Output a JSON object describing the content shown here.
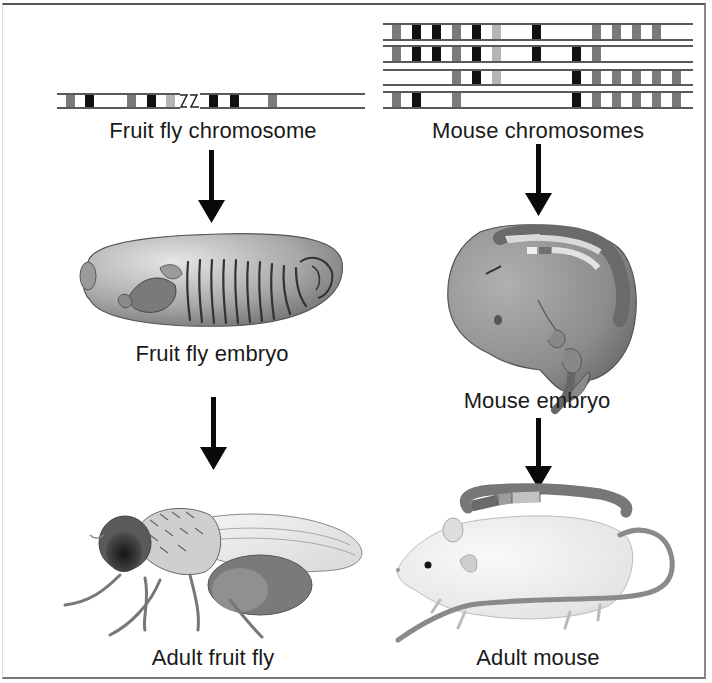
{
  "left_column": {
    "chromosome_label": "Fruit fly chromosome",
    "embryo_label": "Fruit fly embryo",
    "adult_label": "Adult fruit fly"
  },
  "right_column": {
    "chromosome_label": "Mouse chromosomes",
    "embryo_label": "Mouse embryo",
    "adult_label": "Adult mouse"
  },
  "colors": {
    "black_band": "#111111",
    "gray_band": "#7a7a7a",
    "light_band": "#b5b5b5",
    "line": "#222222",
    "arrow": "#0a0a0a"
  },
  "fly_chromosome": {
    "bands": [
      {
        "x": 66,
        "tone": "gray"
      },
      {
        "x": 85,
        "tone": "black"
      },
      {
        "x": 127,
        "tone": "gray"
      },
      {
        "x": 147,
        "tone": "black"
      },
      {
        "x": 166,
        "tone": "light"
      },
      {
        "x": 209,
        "tone": "black"
      },
      {
        "x": 230,
        "tone": "black"
      },
      {
        "x": 268,
        "tone": "gray"
      }
    ],
    "break_marker": "zigzag-break"
  },
  "mouse_chromosomes": [
    {
      "bands": [
        {
          "x": 392,
          "tone": "gray"
        },
        {
          "x": 412,
          "tone": "black"
        },
        {
          "x": 432,
          "tone": "black"
        },
        {
          "x": 452,
          "tone": "gray"
        },
        {
          "x": 472,
          "tone": "black"
        },
        {
          "x": 492,
          "tone": "light"
        },
        {
          "x": 532,
          "tone": "black"
        },
        {
          "x": 592,
          "tone": "gray"
        },
        {
          "x": 612,
          "tone": "gray"
        },
        {
          "x": 632,
          "tone": "gray"
        },
        {
          "x": 652,
          "tone": "gray"
        }
      ]
    },
    {
      "bands": [
        {
          "x": 392,
          "tone": "gray"
        },
        {
          "x": 412,
          "tone": "black"
        },
        {
          "x": 432,
          "tone": "black"
        },
        {
          "x": 452,
          "tone": "gray"
        },
        {
          "x": 472,
          "tone": "black"
        },
        {
          "x": 492,
          "tone": "light"
        },
        {
          "x": 532,
          "tone": "black"
        },
        {
          "x": 572,
          "tone": "black"
        },
        {
          "x": 592,
          "tone": "gray"
        }
      ]
    },
    {
      "bands": [
        {
          "x": 452,
          "tone": "gray"
        },
        {
          "x": 472,
          "tone": "black"
        },
        {
          "x": 492,
          "tone": "light"
        },
        {
          "x": 572,
          "tone": "black"
        },
        {
          "x": 592,
          "tone": "gray"
        },
        {
          "x": 612,
          "tone": "gray"
        },
        {
          "x": 632,
          "tone": "gray"
        },
        {
          "x": 652,
          "tone": "gray"
        },
        {
          "x": 672,
          "tone": "gray"
        }
      ]
    },
    {
      "bands": [
        {
          "x": 392,
          "tone": "gray"
        },
        {
          "x": 412,
          "tone": "black"
        },
        {
          "x": 452,
          "tone": "gray"
        },
        {
          "x": 572,
          "tone": "black"
        },
        {
          "x": 592,
          "tone": "gray"
        },
        {
          "x": 612,
          "tone": "gray"
        },
        {
          "x": 632,
          "tone": "gray"
        },
        {
          "x": 652,
          "tone": "gray"
        },
        {
          "x": 672,
          "tone": "gray"
        }
      ]
    }
  ],
  "arrows": [
    {
      "id": "fly-chromosome-to-embryo"
    },
    {
      "id": "fly-embryo-to-adult"
    },
    {
      "id": "mouse-chromosomes-to-embryo"
    },
    {
      "id": "mouse-embryo-to-adult"
    }
  ]
}
